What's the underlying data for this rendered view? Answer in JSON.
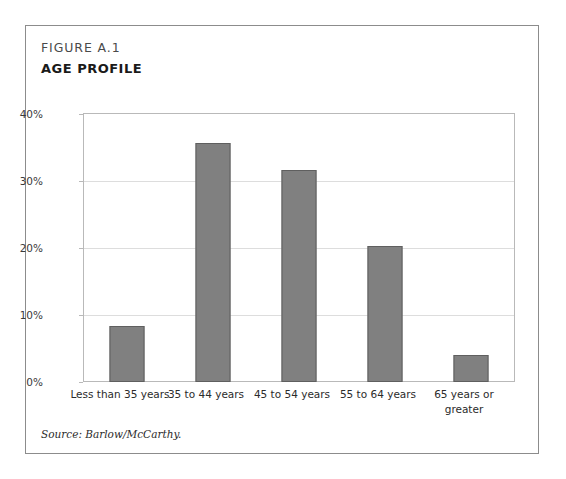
{
  "figure": {
    "number": "FIGURE A.1",
    "title": "AGE PROFILE",
    "source": "Source: Barlow/McCarthy."
  },
  "chart_data": {
    "type": "bar",
    "title": "AGE PROFILE",
    "subtitle": "FIGURE A.1",
    "xlabel": "",
    "ylabel": "",
    "categories": [
      "Less than 35 years",
      "35 to 44 years",
      "45 to 54 years",
      "55 to 64 years",
      "65 years or greater"
    ],
    "values": [
      8.4,
      35.7,
      31.6,
      20.3,
      4.0
    ],
    "ylim": [
      0,
      40
    ],
    "yticks": [
      0,
      10,
      20,
      30,
      40
    ],
    "ytick_labels": [
      "0%",
      "10%",
      "20%",
      "30%",
      "40%"
    ],
    "grid": true,
    "legend": false,
    "bar_color": "#808080",
    "bar_border_color": "#5f5f5f",
    "gridline_color": "#dddddd",
    "plot_border_color": "#b9b9b9",
    "frame_border_color": "#8c8c8c",
    "background_color": "#ffffff"
  }
}
